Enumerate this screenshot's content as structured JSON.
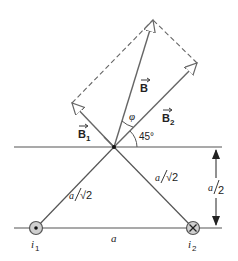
{
  "diagram": {
    "vectors": {
      "B": "B",
      "B1": "B",
      "B1_sub": "1",
      "B2": "B",
      "B2_sub": "2"
    },
    "angles": {
      "phi": "φ",
      "angle45": "45°"
    },
    "distances": {
      "left_slant_num": "a",
      "left_slant_den": "√2",
      "right_slant_num": "a",
      "right_slant_den": "√2",
      "base": "a",
      "height_num": "a",
      "height_den": "2"
    },
    "currents": {
      "i1_label": "i",
      "i1_sub": "1",
      "i1_direction": "out-of-page (dot)",
      "i2_label": "i",
      "i2_sub": "2",
      "i2_direction": "into-page (cross)"
    },
    "colors": {
      "line": "#555555",
      "vector": "#666666",
      "wire_fill": "#bdbdbd"
    }
  }
}
